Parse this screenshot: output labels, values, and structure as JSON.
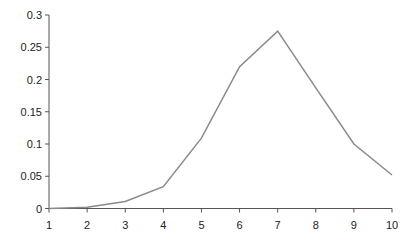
{
  "chart_data": {
    "type": "line",
    "title": "",
    "xlabel": "",
    "ylabel": "",
    "x": [
      1,
      2,
      3,
      4,
      5,
      6,
      7,
      8,
      9,
      10
    ],
    "series": [
      {
        "name": "series-1",
        "values": [
          0.0,
          0.002,
          0.011,
          0.034,
          0.109,
          0.22,
          0.275,
          0.187,
          0.1,
          0.052
        ],
        "color": "#8a8a8a"
      }
    ],
    "xlim": [
      1,
      10
    ],
    "ylim": [
      0,
      0.3
    ],
    "x_ticks": [
      "1",
      "2",
      "3",
      "4",
      "5",
      "6",
      "7",
      "8",
      "9",
      "10"
    ],
    "y_ticks": [
      "0",
      "0.05",
      "0.1",
      "0.15",
      "0.2",
      "0.25",
      "0.3"
    ],
    "grid": false,
    "legend": null
  }
}
